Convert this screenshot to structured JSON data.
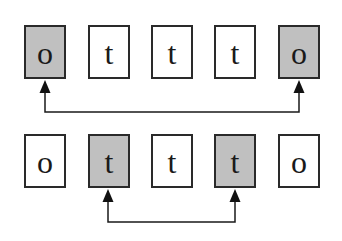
{
  "diagram": {
    "rows": [
      {
        "cells": [
          {
            "label": "o",
            "highlighted": true
          },
          {
            "label": "t",
            "highlighted": false
          },
          {
            "label": "t",
            "highlighted": false
          },
          {
            "label": "t",
            "highlighted": false
          },
          {
            "label": "o",
            "highlighted": true
          }
        ],
        "link": {
          "from": 0,
          "to": 4
        }
      },
      {
        "cells": [
          {
            "label": "o",
            "highlighted": false
          },
          {
            "label": "t",
            "highlighted": true
          },
          {
            "label": "t",
            "highlighted": false
          },
          {
            "label": "t",
            "highlighted": true
          },
          {
            "label": "o",
            "highlighted": false
          }
        ],
        "link": {
          "from": 1,
          "to": 3
        }
      }
    ],
    "colors": {
      "highlight_fill": "#c0c0c0",
      "border": "#2a2a2a",
      "arrow": "#1a1a1a"
    }
  }
}
